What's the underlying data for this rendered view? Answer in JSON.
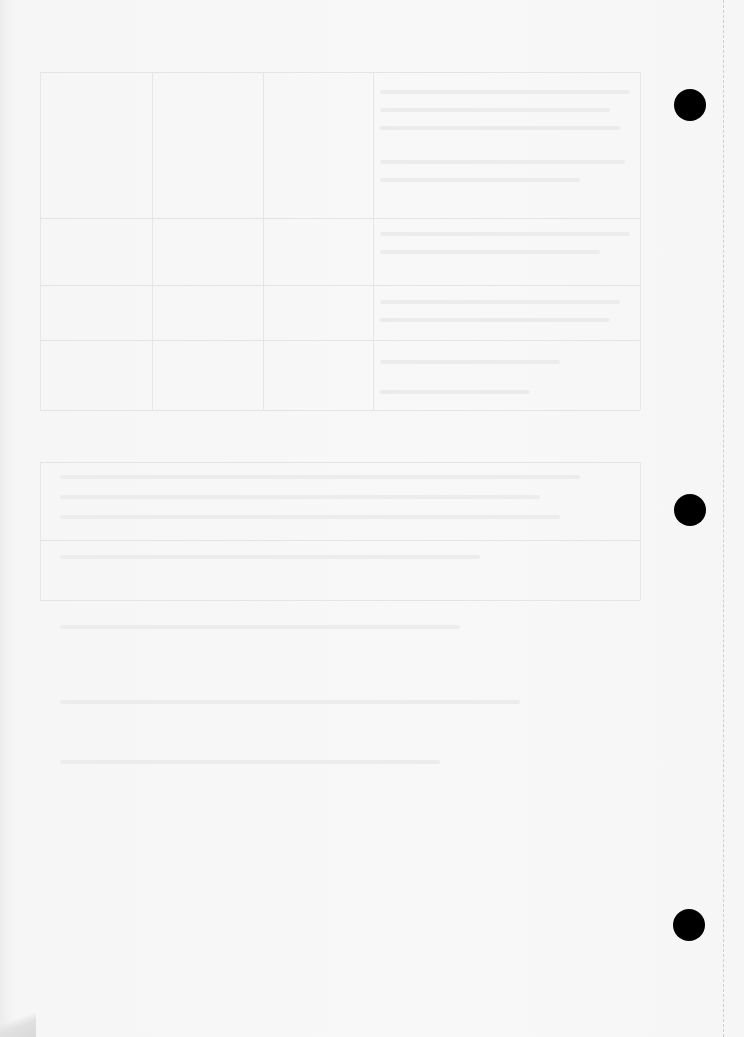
{
  "document": {
    "type": "scanned page (reverse side, bleed-through only)",
    "visible_text": "",
    "punch_holes": [
      {
        "cx": 690,
        "cy": 105,
        "r": 16
      },
      {
        "cx": 690,
        "cy": 510,
        "r": 16
      },
      {
        "cx": 689,
        "cy": 925,
        "r": 16
      }
    ],
    "colors": {
      "paper": "#f7f7f7",
      "hole": "#000000",
      "bleed": "#e6e6e6",
      "perforation": "#cfcfcf"
    }
  }
}
